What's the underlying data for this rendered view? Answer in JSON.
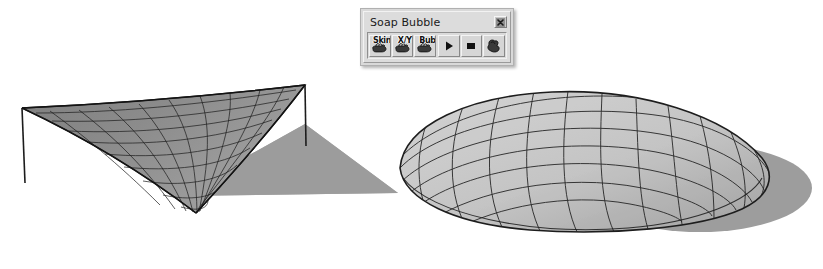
{
  "window": {
    "title": "Soap Bubble",
    "close_label": "x",
    "close_icon": "close-icon"
  },
  "toolbar": {
    "buttons": [
      {
        "id": "skin",
        "label": "Skin",
        "icon": "hand-skin-icon",
        "tooltip": "Skin"
      },
      {
        "id": "xy",
        "label": "X/Y",
        "icon": "hand-xy-icon",
        "tooltip": "X/Y"
      },
      {
        "id": "bub",
        "label": "Bub",
        "icon": "hand-bubble-icon",
        "tooltip": "Bub"
      },
      {
        "id": "play",
        "label": "",
        "icon": "play-icon",
        "tooltip": "Play"
      },
      {
        "id": "stop",
        "label": "",
        "icon": "stop-icon",
        "tooltip": "Stop"
      },
      {
        "id": "grab",
        "label": "",
        "icon": "hand-grab-icon",
        "tooltip": "Grab"
      }
    ]
  },
  "scene": {
    "background": "#ffffff",
    "objects": [
      {
        "id": "saddle-surface",
        "name": "hypar-tent-surface",
        "description": "Hyperbolic paraboloid minimal surface (tent) with quad mesh",
        "fill": "#8e8e8e",
        "mesh_stroke": "#1f1f1f",
        "shadow": "#9a9a9a",
        "poles": 2
      },
      {
        "id": "bubble-dome",
        "name": "soap-bubble-dome",
        "description": "Domed soap bubble surface with quad mesh",
        "fill": "#c3c3c3",
        "mesh_stroke": "#262626",
        "shadow": "#9d9d9d"
      }
    ]
  }
}
